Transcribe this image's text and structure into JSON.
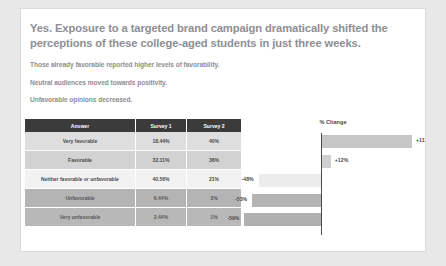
{
  "slide": {
    "headline": "Yes. Exposure to a targeted brand campaign dramatically shifted the perceptions of these college-aged students in just three weeks.",
    "body_lines": [
      "Those already favorable reported higher levels of favorability.",
      "Neutral audiences moved towards positivity.",
      "Unfavorable opinions decreased."
    ]
  },
  "table": {
    "columns": [
      "Answer",
      "Survey 1",
      "Survey 2"
    ],
    "rows": [
      {
        "answer": "Very favorable",
        "survey1": "18.44%",
        "survey2": "40%"
      },
      {
        "answer": "Favorable",
        "survey1": "32.11%",
        "survey2": "36%"
      },
      {
        "answer": "Neither favorable or unfavorable",
        "survey1": "40.56%",
        "survey2": "21%"
      },
      {
        "answer": "Unfavorable",
        "survey1": "6.44%",
        "survey2": "3%"
      },
      {
        "answer": "Very unfavorable",
        "survey1": "2.44%",
        "survey2": "1%"
      }
    ]
  },
  "chart_data": {
    "type": "bar",
    "orientation": "horizontal",
    "title": "% Change",
    "xlabel": "",
    "ylabel": "",
    "grid": false,
    "legend": false,
    "zero_axis": true,
    "categories": [
      "Very favorable",
      "Favorable",
      "Neither favorable or unfavorable",
      "Unfavorable",
      "Very unfavorable"
    ],
    "values": [
      111,
      12,
      -48,
      -53,
      -59
    ],
    "labels": [
      "+111%",
      "+12%",
      "-48%",
      "-53%",
      "-59%"
    ],
    "xlim": [
      -60,
      120
    ],
    "bar_colors": [
      "#c6c6c6",
      "#cfcfcf",
      "#ececec",
      "#b4b4b4",
      "#b0b0b0"
    ]
  },
  "colors": {
    "page_background": "#e8e8e8",
    "card_background": "#ffffff",
    "header_row": "#3b3b3b",
    "text_muted": "#8e8e93",
    "axis": "#4a4a4a"
  }
}
